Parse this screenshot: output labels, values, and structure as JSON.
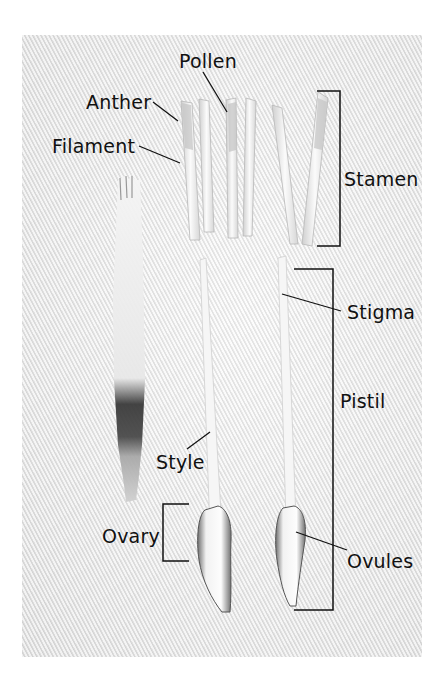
{
  "diagram": {
    "labels": {
      "pollen": "Pollen",
      "anther": "Anther",
      "filament": "Filament",
      "stamen": "Stamen",
      "stigma": "Stigma",
      "pistil": "Pistil",
      "style": "Style",
      "ovary": "Ovary",
      "ovules": "Ovules"
    },
    "brackets": [
      {
        "name": "Stamen",
        "type": "right-bracket"
      },
      {
        "name": "Pistil",
        "type": "right-bracket"
      },
      {
        "name": "Ovary",
        "type": "left-bracket"
      }
    ],
    "colors": {
      "background": "#ffffff",
      "fabric": "#e9e9e9",
      "ink": "#111111"
    }
  }
}
